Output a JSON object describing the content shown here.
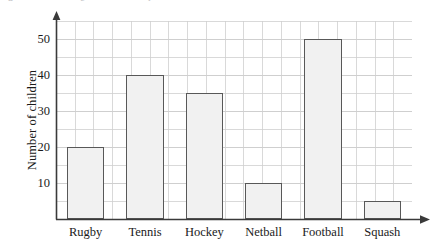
{
  "figure": {
    "clipped_text_fragments": [
      "a",
      "e",
      "r"
    ]
  },
  "chart_data": {
    "type": "bar",
    "title": "",
    "xlabel": "",
    "ylabel": "Number of children",
    "categories": [
      "Rugby",
      "Tennis",
      "Hockey",
      "Netball",
      "Football",
      "Squash"
    ],
    "values": [
      20,
      40,
      35,
      10,
      50,
      5
    ],
    "ylim": [
      0,
      55
    ],
    "y_major_ticks": [
      10,
      20,
      30,
      40,
      50
    ],
    "y_major_tick_labels": [
      "10",
      "20",
      "30",
      "40",
      "50"
    ],
    "y_minor_step": 5,
    "grid": "both",
    "legend": "none",
    "bar_fill": "#f1f1f1",
    "bar_edge": "#585858",
    "grid_color": "#cfcfcf",
    "axis_color": "#3a3a3a",
    "x_axis_arrow": true,
    "y_axis_arrow": true
  }
}
